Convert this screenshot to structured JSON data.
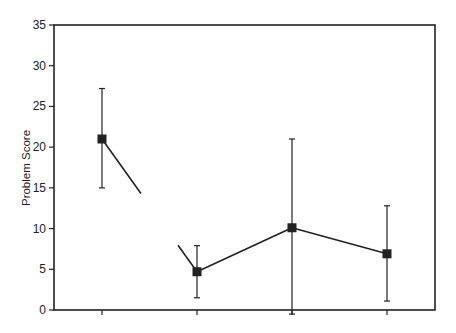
{
  "chart_data": {
    "type": "line",
    "title": "",
    "xlabel": "",
    "ylabel": "Problem Score",
    "ylim": [
      0,
      35
    ],
    "yticks": [
      0,
      5,
      10,
      15,
      20,
      25,
      30,
      35
    ],
    "grid": false,
    "legend": null,
    "categories": [
      "",
      "",
      "",
      ""
    ],
    "series": [
      {
        "name": "Problem Score",
        "marker": "square",
        "values": [
          21.0,
          4.7,
          10.1,
          6.9
        ],
        "error_upper": [
          27.2,
          7.9,
          21.0,
          12.8
        ],
        "error_lower": [
          15.0,
          1.5,
          -0.5,
          1.1
        ]
      }
    ],
    "annotations": [
      "Line between first and second point is broken (discontinuous segment)"
    ]
  },
  "colors": {
    "ink": "#222222",
    "background": "#ffffff"
  }
}
